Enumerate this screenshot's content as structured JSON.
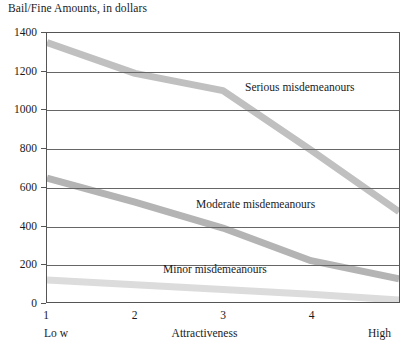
{
  "chart_data": {
    "type": "line",
    "title": "Bail/Fine Amounts, in dollars",
    "xlabel": "Attractiveness",
    "ylabel": "",
    "ylim": [
      0,
      1400
    ],
    "xlim": [
      1,
      5
    ],
    "grid": true,
    "legend_position": "inline-annotations",
    "yticks": [
      0,
      200,
      400,
      600,
      800,
      1000,
      1200,
      1400
    ],
    "ytick_labels": [
      "0",
      "200",
      "400",
      "600",
      "800",
      "1000",
      "1200",
      "1400"
    ],
    "xticks": [
      1,
      2,
      3,
      4
    ],
    "xtick_labels": [
      "1",
      "2",
      "3",
      "4"
    ],
    "x_axis_endpoints": {
      "low": "Lo w",
      "high": "High"
    },
    "x": [
      1,
      2,
      3,
      4,
      5
    ],
    "series": [
      {
        "name": "Serious misdemeanours",
        "label": "Serious misdemeanours",
        "color": "#c0c0c0",
        "values": [
          1350,
          1190,
          1100,
          790,
          470
        ]
      },
      {
        "name": "Moderate misdemeanours",
        "label": "Moderate misdemeanours",
        "color": "#b4b4b4",
        "values": [
          645,
          520,
          385,
          215,
          120
        ]
      },
      {
        "name": "Minor misdemeanours",
        "label": "Minor misdemeanours",
        "color": "#dcdcdc",
        "values": [
          115,
          90,
          65,
          40,
          10
        ]
      }
    ],
    "annotations": [
      {
        "text": "Serious misdemeanours",
        "x": 3.35,
        "y": 1090
      },
      {
        "text": "Moderate misdemeanours",
        "x": 2.75,
        "y": 525
      },
      {
        "text": "Minor misdemeanours",
        "x": 2.35,
        "y": 190
      }
    ],
    "colors": {
      "axis": "#555555",
      "grid": "#666666",
      "text": "#1a1a1a",
      "background": "#ffffff"
    }
  }
}
